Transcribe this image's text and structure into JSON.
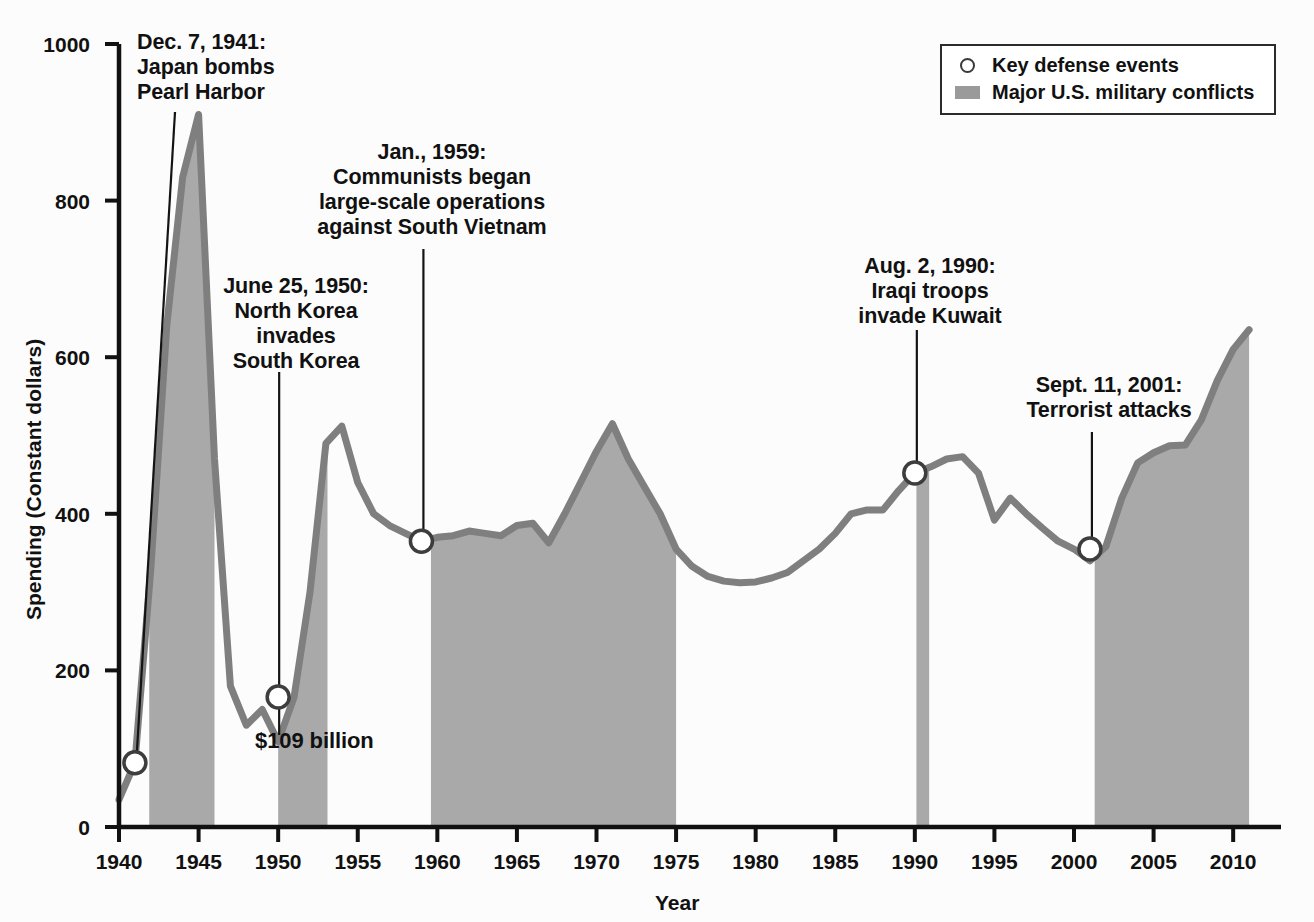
{
  "chart_data": {
    "type": "area",
    "title": "",
    "xlabel": "Year",
    "ylabel": "Spending (Constant dollars)",
    "xlim": [
      1940,
      2012
    ],
    "ylim": [
      0,
      1000
    ],
    "xticks": [
      1940,
      1945,
      1950,
      1955,
      1960,
      1965,
      1970,
      1975,
      1980,
      1985,
      1990,
      1995,
      2000,
      2005,
      2010
    ],
    "yticks": [
      0,
      200,
      400,
      600,
      800,
      1000
    ],
    "grid": false,
    "legend_position": "top-right",
    "series": [
      {
        "name": "U.S. defense spending (constant dollars, billions)",
        "x": [
          1940,
          1941,
          1942,
          1943,
          1944,
          1945,
          1946,
          1947,
          1948,
          1949,
          1950,
          1951,
          1952,
          1953,
          1954,
          1955,
          1956,
          1957,
          1958,
          1959,
          1960,
          1961,
          1962,
          1963,
          1964,
          1965,
          1966,
          1967,
          1968,
          1969,
          1970,
          1971,
          1972,
          1973,
          1974,
          1975,
          1976,
          1977,
          1978,
          1979,
          1980,
          1981,
          1982,
          1983,
          1984,
          1985,
          1986,
          1987,
          1988,
          1989,
          1990,
          1991,
          1992,
          1993,
          1994,
          1995,
          1996,
          1997,
          1998,
          1999,
          2000,
          2001,
          2002,
          2003,
          2004,
          2005,
          2006,
          2007,
          2008,
          2009,
          2010,
          2011
        ],
        "values": [
          35,
          82,
          330,
          640,
          830,
          910,
          470,
          180,
          130,
          150,
          109,
          166,
          300,
          490,
          512,
          440,
          400,
          385,
          375,
          365,
          370,
          372,
          378,
          375,
          372,
          385,
          388,
          363,
          400,
          440,
          480,
          515,
          470,
          435,
          400,
          355,
          333,
          320,
          314,
          312,
          313,
          318,
          325,
          340,
          355,
          375,
          400,
          405,
          405,
          430,
          452,
          460,
          470,
          473,
          452,
          392,
          420,
          400,
          382,
          365,
          355,
          340,
          358,
          420,
          465,
          478,
          487,
          488,
          520,
          570,
          610,
          635
        ]
      }
    ],
    "markers": [
      {
        "label": "1941 event marker",
        "x": 1941,
        "y": 82
      },
      {
        "label": "1950 event marker",
        "x": 1950,
        "y": 166
      },
      {
        "label": "1959 event marker",
        "x": 1959,
        "y": 365
      },
      {
        "label": "1990 event marker",
        "x": 1990,
        "y": 452
      },
      {
        "label": "2001 event marker",
        "x": 2001,
        "y": 355
      }
    ],
    "conflict_bands": [
      {
        "name": "World War II",
        "start": 1941.9,
        "end": 1946.0
      },
      {
        "name": "Korean War",
        "start": 1950.0,
        "end": 1953.1
      },
      {
        "name": "Vietnam War",
        "start": 1959.6,
        "end": 1975.0
      },
      {
        "name": "Gulf War",
        "start": 1990.1,
        "end": 1990.9
      },
      {
        "name": "Iraq / Afghanistan",
        "start": 2001.3,
        "end": 2011.2
      }
    ],
    "annotations": [
      {
        "id": "pearl-harbor",
        "lines": [
          "Dec. 7, 1941:",
          "Japan bombs",
          "Pearl Harbor"
        ],
        "align": "left",
        "points_to_x": 1941,
        "points_to_y": 82
      },
      {
        "id": "korea",
        "lines": [
          "June 25, 1950:",
          "North Korea",
          "invades",
          "South Korea"
        ],
        "align": "center",
        "points_to_x": 1950,
        "points_to_y": 166
      },
      {
        "id": "vietnam",
        "lines": [
          "Jan., 1959:",
          "Communists began",
          "large-scale operations",
          "against South Vietnam"
        ],
        "align": "center",
        "points_to_x": 1959,
        "points_to_y": 365
      },
      {
        "id": "kuwait",
        "lines": [
          "Aug. 2, 1990:",
          "Iraqi troops",
          "invade Kuwait"
        ],
        "align": "center",
        "points_to_x": 1990,
        "points_to_y": 452
      },
      {
        "id": "sept11",
        "lines": [
          "Sept. 11, 2001:",
          "Terrorist attacks"
        ],
        "align": "center",
        "points_to_x": 2001,
        "points_to_y": 355
      },
      {
        "id": "value-callout",
        "lines": [
          "$109 billion"
        ],
        "align": "left",
        "points_to_x": 1950,
        "points_to_y": 109
      }
    ]
  },
  "axes": {
    "ylabel": "Spending (Constant dollars)",
    "xlabel": "Year",
    "yticks": [
      "1000",
      "800",
      "600",
      "400",
      "200",
      "0"
    ],
    "xticks": [
      "1940",
      "1945",
      "1950",
      "1955",
      "1960",
      "1965",
      "1970",
      "1975",
      "1980",
      "1985",
      "1990",
      "1995",
      "2000",
      "2005",
      "2010"
    ]
  },
  "legend": {
    "items": [
      {
        "icon": "open-circle",
        "label": "Key defense events"
      },
      {
        "icon": "filled-rect",
        "label": "Major U.S. military conflicts"
      }
    ]
  },
  "annotations": {
    "pearl_harbor": {
      "l1": "Dec. 7, 1941:",
      "l2": "Japan bombs",
      "l3": "Pearl Harbor"
    },
    "korea": {
      "l1": "June 25, 1950:",
      "l2": "North Korea",
      "l3": "invades",
      "l4": "South Korea"
    },
    "vietnam": {
      "l1": "Jan., 1959:",
      "l2": "Communists began",
      "l3": "large-scale operations",
      "l4": "against South Vietnam"
    },
    "kuwait": {
      "l1": "Aug. 2, 1990:",
      "l2": "Iraqi troops",
      "l3": "invade Kuwait"
    },
    "sept11": {
      "l1": "Sept. 11, 2001:",
      "l2": "Terrorist attacks"
    },
    "value_callout": "$109 billion"
  },
  "colors": {
    "band_fill": "#a9a9a9",
    "line": "#7f7f7f",
    "axis": "#111111",
    "text": "#111111",
    "marker_fill": "#ffffff",
    "background": "#fcfcfc"
  }
}
